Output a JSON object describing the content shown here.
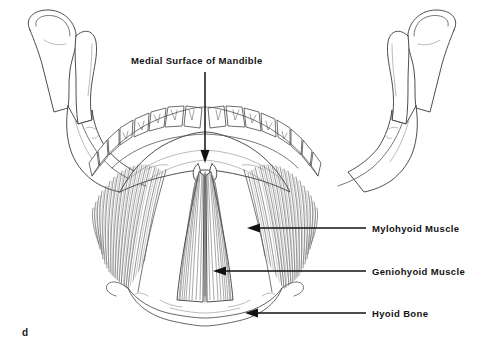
{
  "figure": {
    "panel_letter": "d",
    "title": "Medial Surface of Mandible",
    "background_color": "#ffffff",
    "ink_color": "#121212",
    "view": "posterior-medial view of mandible with floor-of-mouth musculature"
  },
  "callouts": {
    "title_pointer": {
      "label": "Medial Surface of Mandible",
      "arrow_direction": "down",
      "points_to": "inner (lingual) surface of the mandibular body"
    },
    "items": [
      {
        "id": "mylohyoid",
        "label": "Mylohyoid Muscle",
        "arrow_direction": "left",
        "points_to": "fan-shaped sheet sloping from mylohyoid line to hyoid"
      },
      {
        "id": "geniohyoid",
        "label": "Geniohyoid Muscle",
        "arrow_direction": "left",
        "points_to": "paired central straps from genial tubercles to hyoid body"
      },
      {
        "id": "hyoid",
        "label": "Hyoid Bone",
        "arrow_direction": "left",
        "points_to": "U-shaped bone below the muscle sheet"
      }
    ]
  },
  "anatomy": {
    "structures": [
      "left mandibular condyle",
      "left coronoid process",
      "left ramus",
      "mandibular body",
      "dental arch",
      "genial tubercles",
      "mylohyoid muscle",
      "geniohyoid muscle",
      "hyoid bone",
      "right ramus",
      "right coronoid process",
      "right mandibular condyle"
    ],
    "tooth_count_visible": 16,
    "line_art_style": "black ink stipple and hatch on white"
  },
  "colors": {
    "paper": "#ffffff",
    "outline": "#3a3a3a",
    "muscle_fiber": "#4d4d4d",
    "label_text": "#131313",
    "leader": "#121212"
  }
}
